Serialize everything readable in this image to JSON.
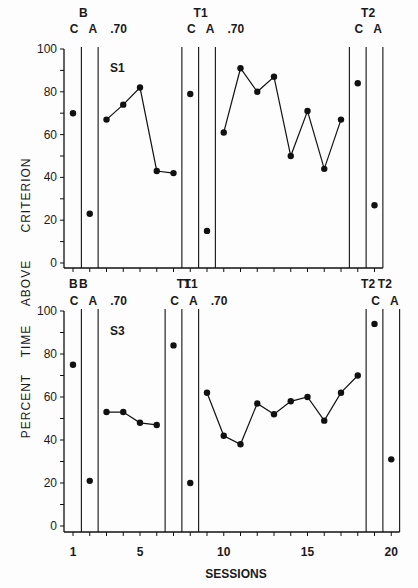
{
  "figure": {
    "xlabel": "SESSIONS",
    "ylabel_top": "ABOVE CRITERION",
    "ylabel_bottom": "PERCENT TIME",
    "ylabel_words": [
      "CRITERION",
      "ABOVE",
      "TIME",
      "PERCENT"
    ]
  },
  "chart_data": [
    {
      "type": "line",
      "panel": "top",
      "subject_label": "S1",
      "ylim": [
        0,
        100
      ],
      "yticks": [
        0,
        20,
        40,
        60,
        80,
        100
      ],
      "xlim": [
        0.5,
        20.5
      ],
      "phase_labels": [
        {
          "group": "B",
          "conditions": [
            "C",
            "A"
          ]
        },
        {
          "label": ".70"
        },
        {
          "group": "T1",
          "conditions": [
            "C",
            "A"
          ]
        },
        {
          "label": ".70"
        },
        {
          "group": "T2",
          "conditions": [
            "C",
            "A"
          ]
        }
      ],
      "bottom_tick_labels": [
        "B",
        "T1",
        "T2"
      ],
      "points": [
        {
          "x": 1,
          "y": 70,
          "phase": "B-C"
        },
        {
          "x": 2,
          "y": 23,
          "phase": "B-A"
        },
        {
          "x": 3,
          "y": 67,
          "phase": ".70"
        },
        {
          "x": 4,
          "y": 74,
          "phase": ".70"
        },
        {
          "x": 5,
          "y": 82,
          "phase": ".70"
        },
        {
          "x": 6,
          "y": 43,
          "phase": ".70"
        },
        {
          "x": 7,
          "y": 42,
          "phase": ".70"
        },
        {
          "x": 8,
          "y": 79,
          "phase": "T1-C"
        },
        {
          "x": 9,
          "y": 15,
          "phase": "T1-A"
        },
        {
          "x": 10,
          "y": 61,
          "phase": ".70"
        },
        {
          "x": 11,
          "y": 91,
          "phase": ".70"
        },
        {
          "x": 12,
          "y": 80,
          "phase": ".70"
        },
        {
          "x": 13,
          "y": 87,
          "phase": ".70"
        },
        {
          "x": 14,
          "y": 50,
          "phase": ".70"
        },
        {
          "x": 15,
          "y": 71,
          "phase": ".70"
        },
        {
          "x": 16,
          "y": 44,
          "phase": ".70"
        },
        {
          "x": 17,
          "y": 67,
          "phase": ".70"
        },
        {
          "x": 18,
          "y": 84,
          "phase": "T2-C"
        },
        {
          "x": 19,
          "y": 27,
          "phase": "T2-A"
        }
      ],
      "connected_segments": [
        [
          3,
          7
        ],
        [
          10,
          17
        ]
      ],
      "phase_lines_x": [
        1.5,
        2.5,
        7.5,
        8.5,
        9.5,
        17.5,
        18.5,
        19.5
      ]
    },
    {
      "type": "line",
      "panel": "bottom",
      "subject_label": "S3",
      "ylim": [
        0,
        100
      ],
      "yticks": [
        0,
        20,
        40,
        60,
        80,
        100
      ],
      "xlim": [
        0.5,
        20.5
      ],
      "xticks": [
        1,
        5,
        10,
        15,
        20
      ],
      "phase_labels": [
        {
          "group": "B",
          "conditions": [
            "C",
            "A"
          ]
        },
        {
          "label": ".70"
        },
        {
          "group": "T1",
          "conditions": [
            "C",
            "A"
          ]
        },
        {
          "label": ".70"
        },
        {
          "group": "T2",
          "conditions": [
            "C",
            "A"
          ]
        }
      ],
      "points": [
        {
          "x": 1,
          "y": 75,
          "phase": "B-C"
        },
        {
          "x": 2,
          "y": 21,
          "phase": "B-A"
        },
        {
          "x": 3,
          "y": 53,
          "phase": ".70"
        },
        {
          "x": 4,
          "y": 53,
          "phase": ".70"
        },
        {
          "x": 5,
          "y": 48,
          "phase": ".70"
        },
        {
          "x": 6,
          "y": 47,
          "phase": ".70"
        },
        {
          "x": 7,
          "y": 84,
          "phase": "T1-C"
        },
        {
          "x": 8,
          "y": 20,
          "phase": "T1-A"
        },
        {
          "x": 9,
          "y": 62,
          "phase": ".70"
        },
        {
          "x": 10,
          "y": 42,
          "phase": ".70"
        },
        {
          "x": 11,
          "y": 38,
          "phase": ".70"
        },
        {
          "x": 12,
          "y": 57,
          "phase": ".70"
        },
        {
          "x": 13,
          "y": 52,
          "phase": ".70"
        },
        {
          "x": 14,
          "y": 58,
          "phase": ".70"
        },
        {
          "x": 15,
          "y": 60,
          "phase": ".70"
        },
        {
          "x": 16,
          "y": 49,
          "phase": ".70"
        },
        {
          "x": 17,
          "y": 62,
          "phase": ".70"
        },
        {
          "x": 18,
          "y": 70,
          "phase": ".70"
        },
        {
          "x": 19,
          "y": 94,
          "phase": "T2-C"
        },
        {
          "x": 20,
          "y": 31,
          "phase": "T2-A"
        }
      ],
      "connected_segments": [
        [
          3,
          6
        ],
        [
          9,
          18
        ]
      ],
      "phase_lines_x": [
        1.5,
        2.5,
        6.5,
        7.5,
        8.5,
        18.5,
        19.5,
        20.5
      ]
    }
  ]
}
